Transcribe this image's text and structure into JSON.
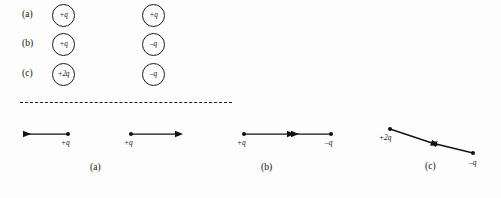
{
  "figure": {
    "ink_color": "#111111",
    "background_color": "#fdfdfd"
  },
  "top_section": {
    "rows": [
      {
        "label": "(a)",
        "left_charge": "+q",
        "right_charge": "+q"
      },
      {
        "label": "(b)",
        "left_charge": "+q",
        "right_charge": "–q"
      },
      {
        "label": "(c)",
        "left_charge": "+2q",
        "right_charge": "–q"
      }
    ]
  },
  "divider": {
    "style": "dashed"
  },
  "bottom_section": {
    "panels": [
      {
        "caption": "(a)",
        "interaction": "repulsion",
        "charges": [
          {
            "label": "+q",
            "force_direction": "left"
          },
          {
            "label": "+q",
            "force_direction": "right"
          }
        ]
      },
      {
        "caption": "(b)",
        "interaction": "attraction",
        "charges": [
          {
            "label": "+q",
            "force_direction": "right"
          },
          {
            "label": "–q",
            "force_direction": "left"
          }
        ]
      },
      {
        "caption": "(c)",
        "interaction": "attraction",
        "charges": [
          {
            "label": "+2q",
            "force_direction": "down-right"
          },
          {
            "label": "–q",
            "force_direction": "up-left"
          }
        ]
      }
    ]
  }
}
